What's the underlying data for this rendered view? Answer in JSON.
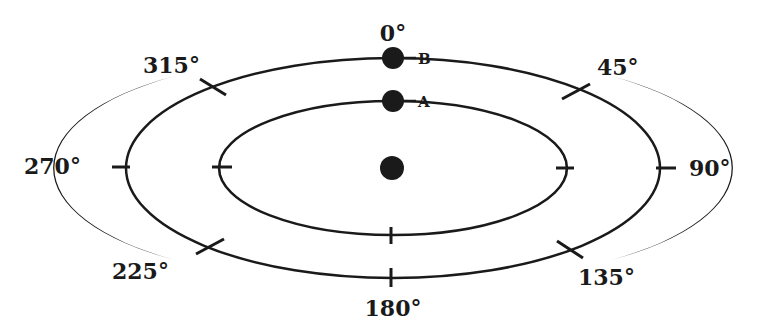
{
  "diagram": {
    "title": "",
    "colors": {
      "ink": "#1a1a1a",
      "background": "#ffffff"
    },
    "angle_labels": {
      "a0": "0°",
      "a45": "45°",
      "a90": "90°",
      "a135": "135°",
      "a180": "180°",
      "a225": "225°",
      "a270": "270°",
      "a315": "315°"
    },
    "points": {
      "B": "B",
      "A": "A"
    },
    "rings": [
      {
        "name": "outer-orbit",
        "point": "B"
      },
      {
        "name": "inner-orbit",
        "point": "A"
      }
    ],
    "center": {
      "name": "central-body"
    }
  }
}
